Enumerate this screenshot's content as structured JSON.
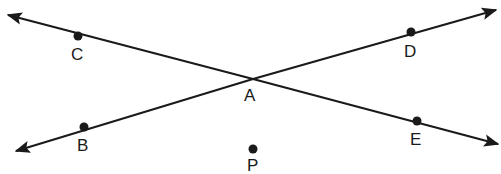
{
  "diagram": {
    "type": "intersecting-lines",
    "points": [
      {
        "label": "C",
        "x": 78,
        "y": 36
      },
      {
        "label": "D",
        "x": 411,
        "y": 32
      },
      {
        "label": "A",
        "x": 253,
        "y": 79
      },
      {
        "label": "B",
        "x": 84,
        "y": 127
      },
      {
        "label": "E",
        "x": 417,
        "y": 121
      },
      {
        "label": "P",
        "x": 253,
        "y": 149
      }
    ],
    "labels": {
      "C": "C",
      "D": "D",
      "A": "A",
      "B": "B",
      "E": "E",
      "P": "P"
    },
    "lines": [
      {
        "name": "line-CE",
        "through": [
          "C",
          "A",
          "E"
        ],
        "arrows": "both"
      },
      {
        "name": "line-BD",
        "through": [
          "B",
          "A",
          "D"
        ],
        "arrows": "both"
      }
    ],
    "color": "#1a1a1a"
  }
}
